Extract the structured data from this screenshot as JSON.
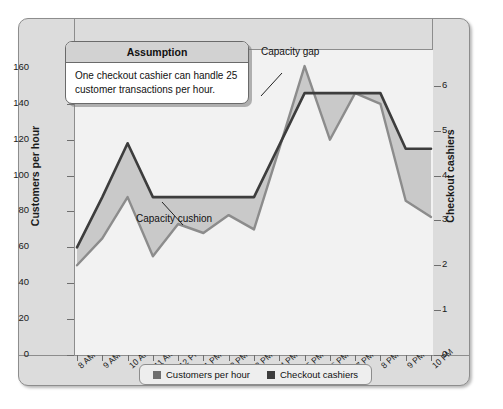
{
  "chart_data": {
    "type": "line",
    "title": "",
    "xlabel": "",
    "ylabel": "Customers per hour",
    "y2label": "Checkout cashiers",
    "grid": false,
    "legend_position": "bottom",
    "categories": [
      "8 AM",
      "9 AM",
      "10 AM",
      "11 AM",
      "12 PM",
      "1 PM",
      "2 PM",
      "3 PM",
      "4 PM",
      "5 PM",
      "6 PM",
      "7 PM",
      "8 PM",
      "9 PM",
      "10 PM"
    ],
    "ylim": [
      0,
      170
    ],
    "yticks": [
      0,
      20,
      40,
      60,
      80,
      100,
      120,
      140,
      160
    ],
    "y2lim": [
      0,
      6.8
    ],
    "y2ticks": [
      0,
      1,
      2,
      3,
      4,
      5,
      6
    ],
    "series": [
      {
        "name": "Customers per hour",
        "axis": "left",
        "color": "#3d3d3d",
        "values": [
          60,
          88,
          118,
          88,
          88,
          88,
          88,
          88,
          117,
          146,
          146,
          146,
          146,
          115,
          115
        ]
      },
      {
        "name": "Checkout cashiers",
        "axis": "right",
        "color": "#8c8c8c",
        "units": "cashiers",
        "values": [
          2.0,
          2.6,
          3.5,
          2.2,
          2.9,
          2.7,
          3.1,
          2.8,
          4.6,
          6.4,
          4.8,
          5.8,
          5.6,
          3.4,
          3.1
        ],
        "values_as_customers": [
          50,
          65,
          88,
          55,
          73,
          68,
          78,
          70,
          115,
          161,
          120,
          146,
          140,
          86,
          77
        ]
      }
    ],
    "annotations": [
      {
        "name": "capacity-gap",
        "text": "Capacity gap"
      },
      {
        "name": "capacity-cushion",
        "text": "Capacity cushion"
      }
    ]
  },
  "assumption": {
    "header": "Assumption",
    "body": "One checkout cashier can handle 25 customer transactions per hour."
  },
  "legend": {
    "items": [
      {
        "label": "Customers per hour",
        "color": "#6f6f6f"
      },
      {
        "label": "Checkout cashiers",
        "color": "#3d3d3d"
      }
    ]
  },
  "colors": {
    "frame_band": "#dcdcdc",
    "plot_background": "#f2f2f2",
    "fill_between": "#c9c9c9",
    "line_dark": "#3d3d3d",
    "line_gray": "#8c8c8c"
  }
}
